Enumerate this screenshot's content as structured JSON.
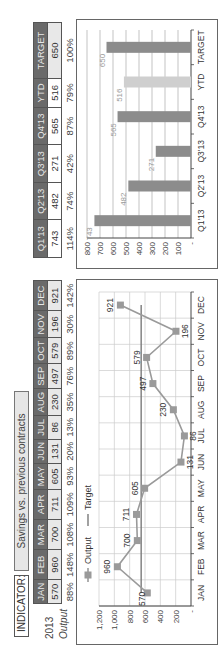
{
  "indicator": {
    "label": "INDICATOR:",
    "value": "Savings vs. previous contracts"
  },
  "monthly_table": {
    "year_label": "2013",
    "row_label": "Output",
    "months": [
      "JAN",
      "FEB",
      "MAR",
      "APR",
      "MAY",
      "JUN",
      "JUL",
      "AUG",
      "SEP",
      "OCT",
      "NOV",
      "DEC"
    ],
    "values": [
      "570",
      "960",
      "700",
      "711",
      "605",
      "131",
      "86",
      "230",
      "497",
      "579",
      "196",
      "921"
    ],
    "percents": [
      "88%",
      "148%",
      "108%",
      "109%",
      "93%",
      "20%",
      "13%",
      "35%",
      "76%",
      "89%",
      "30%",
      "142%"
    ]
  },
  "quarterly_table": {
    "headers": [
      "Q1'13",
      "Q2'13",
      "Q3'13",
      "Q4'13",
      "YTD",
      "TARGET"
    ],
    "values": [
      "743",
      "482",
      "271",
      "565",
      "516",
      "650"
    ],
    "percents": [
      "114%",
      "74%",
      "42%",
      "87%",
      "79%",
      "100%"
    ]
  },
  "colors": {
    "header_bg": "#6a6a6a",
    "value_bg": "#e8e8e8",
    "line": "#9a9a9a",
    "marker": "#9a9a9a",
    "target_line": "#7a7a7a",
    "bar": "#8c8c8c",
    "bar_ytd": "#cfcfcf",
    "grid": "#cccccc"
  },
  "chart_data": [
    {
      "type": "line",
      "title": "",
      "legend": [
        "Output",
        "Target"
      ],
      "legend_position": "top",
      "categories": [
        "JAN",
        "FEB",
        "MAR",
        "APR",
        "MAY",
        "JUN",
        "JUL",
        "AUG",
        "SEP",
        "OCT",
        "NOV",
        "DEC"
      ],
      "series": [
        {
          "name": "Output",
          "values": [
            570,
            960,
            700,
            711,
            605,
            131,
            86,
            230,
            497,
            579,
            196,
            921
          ],
          "markers": "square",
          "data_labels": true
        },
        {
          "name": "Target",
          "values": [
            650,
            650,
            650,
            650,
            650,
            650,
            650,
            650,
            650,
            650,
            650,
            650
          ],
          "markers": "none"
        }
      ],
      "y_ticks": [
        "-",
        "200",
        "400",
        "600",
        "800",
        "1,000",
        "1,200"
      ],
      "ylim": [
        0,
        1200
      ],
      "xlabel": "",
      "ylabel": "",
      "grid": true
    },
    {
      "type": "bar",
      "title": "",
      "categories": [
        "Q1'13",
        "Q2'13",
        "Q3'13",
        "Q4'13",
        "YTD",
        "TARGET"
      ],
      "values": [
        743,
        482,
        271,
        565,
        516,
        650
      ],
      "highlight": {
        "YTD": "lighter"
      },
      "y_ticks": [
        "-",
        "100",
        "200",
        "300",
        "400",
        "500",
        "600",
        "700",
        "800"
      ],
      "ylim": [
        0,
        800
      ],
      "xlabel": "",
      "ylabel": "",
      "grid": true,
      "data_labels": true
    }
  ]
}
